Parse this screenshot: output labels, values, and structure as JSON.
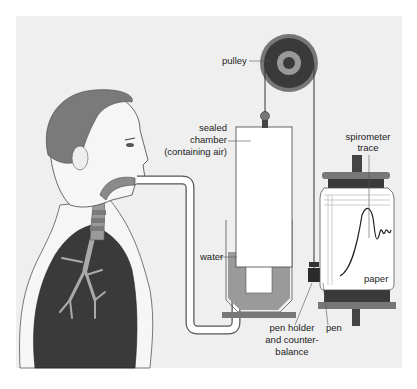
{
  "diagram": {
    "labels": {
      "pulley": "pulley",
      "chamber_line1": "sealed",
      "chamber_line2": "chamber",
      "chamber_line3": "(containing air)",
      "trace_line1": "spirometer",
      "trace_line2": "trace",
      "water": "water",
      "paper": "paper",
      "pen_holder_line1": "pen holder",
      "pen_holder_line2": "and counter-",
      "pen_holder_line3": "balance",
      "pen": "pen"
    },
    "colors": {
      "background": "#efefef",
      "dark": "#3a3a3a",
      "mid_gray": "#8a8a8a",
      "water": "#9a9a9a",
      "white": "#ffffff",
      "skin": "#f4f4f4",
      "hair": "#7a7a7a"
    }
  }
}
